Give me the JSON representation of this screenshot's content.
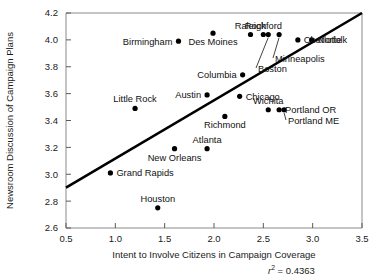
{
  "chart_data": {
    "type": "scatter",
    "title": "",
    "xlabel": "Intent to Involve Citizens in Campaign Coverage",
    "ylabel": "Newsroom Discussion of Campaign Plans",
    "xlim": [
      0.5,
      3.5
    ],
    "ylim": [
      2.6,
      4.2
    ],
    "xticks": [
      "0.5",
      "1.0",
      "1.5",
      "2.0",
      "2.5",
      "3.0",
      "3.5"
    ],
    "xtick_values": [
      0.5,
      1.0,
      1.5,
      2.0,
      2.5,
      3.0,
      3.5
    ],
    "yticks": [
      "2.6",
      "2.8",
      "3.0",
      "3.2",
      "3.4",
      "3.6",
      "3.8",
      "4.0",
      "4.2"
    ],
    "ytick_values": [
      2.6,
      2.8,
      3.0,
      3.2,
      3.4,
      3.6,
      3.8,
      4.0,
      4.2
    ],
    "grid": false,
    "legend": false,
    "annotation": "r2 = 0.4363",
    "r_squared": 0.4363,
    "r_squared_text": "= 0.4363",
    "r_symbol": "r",
    "r_exponent": "2",
    "trendline": {
      "type": "linear",
      "x_start": 0.5,
      "y_start": 2.9,
      "x_end": 3.5,
      "y_end": 4.2
    },
    "points": [
      {
        "label": "Birmingham",
        "x": 1.64,
        "y": 3.99,
        "label_pos": "left"
      },
      {
        "label": "Des Moines",
        "x": 1.99,
        "y": 4.05,
        "label_pos": "below"
      },
      {
        "label": "Raleigh",
        "x": 2.37,
        "y": 4.04,
        "label_pos": "above"
      },
      {
        "label": "Rockford",
        "x": 2.5,
        "y": 4.04,
        "label_pos": "above"
      },
      {
        "label": "Boston",
        "x": 2.55,
        "y": 4.04,
        "label_pos": "leader"
      },
      {
        "label": "Minneapolis",
        "x": 2.66,
        "y": 4.04,
        "label_pos": "leader"
      },
      {
        "label": "Charlotte",
        "x": 2.85,
        "y": 4.0,
        "label_pos": "right"
      },
      {
        "label": "Norfolk",
        "x": 2.99,
        "y": 4.0,
        "label_pos": "right"
      },
      {
        "label": "Columbia",
        "x": 2.29,
        "y": 3.74,
        "label_pos": "left"
      },
      {
        "label": "Austin",
        "x": 1.93,
        "y": 3.59,
        "label_pos": "left"
      },
      {
        "label": "Little Rock",
        "x": 1.2,
        "y": 3.49,
        "label_pos": "above"
      },
      {
        "label": "Chicago",
        "x": 2.26,
        "y": 3.58,
        "label_pos": "right"
      },
      {
        "label": "Wichita",
        "x": 2.55,
        "y": 3.48,
        "label_pos": "above"
      },
      {
        "label": "Portland OR",
        "x": 2.66,
        "y": 3.48,
        "label_pos": "right"
      },
      {
        "label": "Portland ME",
        "x": 2.71,
        "y": 3.48,
        "label_pos": "leader"
      },
      {
        "label": "Richmond",
        "x": 2.11,
        "y": 3.43,
        "label_pos": "below"
      },
      {
        "label": "Atlanta",
        "x": 1.93,
        "y": 3.19,
        "label_pos": "above"
      },
      {
        "label": "New Orleans",
        "x": 1.6,
        "y": 3.19,
        "label_pos": "below"
      },
      {
        "label": "Grand Rapids",
        "x": 0.95,
        "y": 3.01,
        "label_pos": "right"
      },
      {
        "label": "Houston",
        "x": 1.43,
        "y": 2.75,
        "label_pos": "above"
      }
    ]
  }
}
